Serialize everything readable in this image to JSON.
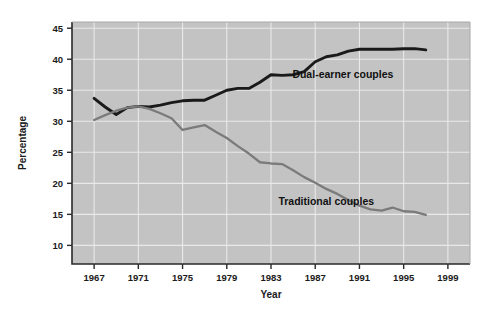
{
  "chart_data": {
    "type": "line",
    "title": "",
    "xlabel": "Year",
    "ylabel": "Percentage",
    "xlim": [
      1965,
      2001
    ],
    "ylim": [
      7,
      46
    ],
    "grid": true,
    "legend_position": "inline-annotations",
    "xticks": [
      1967,
      1971,
      1975,
      1979,
      1983,
      1987,
      1991,
      1995,
      1999
    ],
    "xtick_labels": [
      "1967",
      "1971",
      "1975",
      "1979",
      "1983",
      "1987",
      "1991",
      "1995",
      "1999"
    ],
    "yticks": [
      10,
      15,
      20,
      25,
      30,
      35,
      40,
      45
    ],
    "ytick_labels": [
      "10",
      "15",
      "20",
      "25",
      "30",
      "35",
      "40",
      "45"
    ],
    "x": [
      1967,
      1968,
      1969,
      1970,
      1971,
      1972,
      1973,
      1974,
      1975,
      1976,
      1977,
      1978,
      1979,
      1980,
      1981,
      1982,
      1983,
      1984,
      1985,
      1986,
      1987,
      1988,
      1989,
      1990,
      1991,
      1992,
      1993,
      1994,
      1995,
      1996,
      1997
    ],
    "series": [
      {
        "name": "Dual-earner couples",
        "color": "#1a1a1a",
        "label_x": 1989.5,
        "label_y": 37.0,
        "values": [
          33.7,
          32.3,
          31.1,
          32.2,
          32.4,
          32.3,
          32.6,
          33.0,
          33.3,
          33.4,
          33.4,
          34.2,
          35.0,
          35.3,
          35.3,
          36.3,
          37.5,
          37.4,
          37.5,
          38.0,
          39.6,
          40.4,
          40.7,
          41.3,
          41.6,
          41.6,
          41.6,
          41.6,
          41.7,
          41.7,
          41.5
        ]
      },
      {
        "name": "Traditional couples",
        "color": "#7b7b7b",
        "label_x": 1988.0,
        "label_y": 16.5,
        "values": [
          30.2,
          31.0,
          31.7,
          32.2,
          32.4,
          32.0,
          31.3,
          30.5,
          28.6,
          29.0,
          29.4,
          28.3,
          27.3,
          26.0,
          24.8,
          23.4,
          23.2,
          23.1,
          22.1,
          21.0,
          20.1,
          19.1,
          18.3,
          17.3,
          16.4,
          15.8,
          15.6,
          16.1,
          15.5,
          15.4,
          14.9
        ]
      }
    ]
  }
}
